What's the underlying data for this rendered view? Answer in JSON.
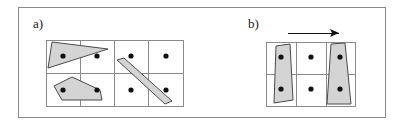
{
  "figure": {
    "width": 404,
    "height": 126,
    "background_color": "#ffffff",
    "frame": {
      "name": "outer-border",
      "x": 18,
      "y": 7,
      "width": 367,
      "height": 110,
      "stroke_color": "#8a8a8a",
      "stroke_width": 1,
      "fill": "none"
    },
    "colors": {
      "shape_fill": "#d4d4d4",
      "shape_stroke": "#4a4a4a",
      "grid_stroke": "#8a8a8a",
      "point_color": "#101010",
      "arrow_color": "#101010",
      "label_color": "#202020"
    },
    "panels": [
      {
        "id": "a",
        "label": "a)",
        "label_x": 33,
        "label_y": 28,
        "grid": {
          "name": "grid-a",
          "x": 46,
          "y": 40,
          "width": 137,
          "height": 66,
          "cols": 4,
          "rows": 2,
          "col_edges": [
            46,
            80,
            114,
            148,
            183
          ],
          "row_edges": [
            40,
            73,
            106
          ]
        },
        "points": [
          {
            "cx": 63,
            "cy": 56
          },
          {
            "cx": 97,
            "cy": 56
          },
          {
            "cx": 131,
            "cy": 56
          },
          {
            "cx": 166,
            "cy": 56
          },
          {
            "cx": 63,
            "cy": 90
          },
          {
            "cx": 97,
            "cy": 90
          },
          {
            "cx": 131,
            "cy": 90
          },
          {
            "cx": 166,
            "cy": 90
          }
        ],
        "point_radius": 2.6,
        "shapes": [
          {
            "name": "triangle-shape",
            "points": "52,42 108,49 48,68"
          },
          {
            "name": "pentagon-shape",
            "points": "54,86 72,77 100,90 102,100 62,100"
          },
          {
            "name": "diagonal-bar-shape",
            "points": "117,60 124,58 172,101 165,104"
          }
        ]
      },
      {
        "id": "b",
        "label": "b)",
        "label_x": 248,
        "label_y": 28,
        "grid": {
          "name": "grid-b",
          "x": 266,
          "y": 42,
          "width": 89,
          "height": 64,
          "cols": 3,
          "rows": 2,
          "col_edges": [
            266,
            296,
            326,
            355
          ],
          "row_edges": [
            42,
            74,
            106
          ]
        },
        "points": [
          {
            "cx": 281,
            "cy": 57
          },
          {
            "cx": 311,
            "cy": 57
          },
          {
            "cx": 340,
            "cy": 57
          },
          {
            "cx": 281,
            "cy": 89
          },
          {
            "cx": 311,
            "cy": 89
          },
          {
            "cx": 340,
            "cy": 89
          }
        ],
        "point_radius": 2.6,
        "shapes": [
          {
            "name": "left-trapezoid-shape",
            "points": "276,46 290,44 293,100 274,103"
          },
          {
            "name": "right-trapezoid-shape",
            "points": "331,44 345,43 351,104 327,104"
          }
        ],
        "arrow": {
          "name": "motion-arrow",
          "x1": 288,
          "y1": 33,
          "x2": 339,
          "y2": 33,
          "head_points": "339,33 330,29 332,33 330,37"
        }
      }
    ]
  }
}
